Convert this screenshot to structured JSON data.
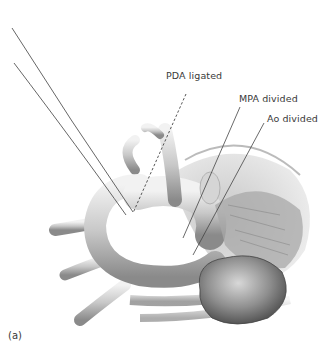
{
  "figure": {
    "panel_label": "(a)",
    "labels": {
      "pda": "PDA ligated",
      "mpa": "MPA divided",
      "ao": "Ao divided"
    },
    "colors": {
      "vessel_fill": "#cfcfcf",
      "vessel_shadow": "#8e8e8e",
      "vessel_highlight": "#f0f0f0",
      "line": "#3d3d3d",
      "text": "#3a3a3a"
    }
  }
}
